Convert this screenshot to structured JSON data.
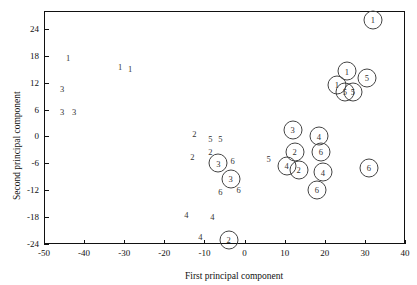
{
  "chart_data": {
    "type": "scatter",
    "title": "",
    "xlabel": "First principal component",
    "ylabel": "Second principal component",
    "xlim": [
      -50,
      40
    ],
    "ylim": [
      -24,
      28
    ],
    "xticks": [
      -50,
      -40,
      -30,
      -20,
      -10,
      0,
      10,
      20,
      30,
      40
    ],
    "yticks": [
      -24,
      -18,
      -12,
      -6,
      0,
      6,
      12,
      18,
      24
    ],
    "grid": false,
    "legend": null,
    "points": [
      {
        "label": "1",
        "x": -44.0,
        "y": 17.5,
        "circled": false
      },
      {
        "label": "1",
        "x": -31.0,
        "y": 15.5,
        "circled": false
      },
      {
        "label": "1",
        "x": -28.5,
        "y": 15.0,
        "circled": false
      },
      {
        "label": "3",
        "x": -45.5,
        "y": 10.5,
        "circled": false
      },
      {
        "label": "3",
        "x": -45.5,
        "y": 5.5,
        "circled": false
      },
      {
        "label": "3",
        "x": -42.5,
        "y": 5.5,
        "circled": false
      },
      {
        "label": "2",
        "x": -12.5,
        "y": 0.5,
        "circled": false
      },
      {
        "label": "5",
        "x": -8.5,
        "y": -0.5,
        "circled": false
      },
      {
        "label": "5",
        "x": -6.0,
        "y": -0.5,
        "circled": false
      },
      {
        "label": "2",
        "x": -13.0,
        "y": -4.5,
        "circled": false
      },
      {
        "label": "2",
        "x": -8.5,
        "y": -3.5,
        "circled": false
      },
      {
        "label": "3",
        "x": -6.5,
        "y": -6.0,
        "circled": true
      },
      {
        "label": "6",
        "x": -3.0,
        "y": -5.5,
        "circled": false
      },
      {
        "label": "3",
        "x": -3.5,
        "y": -9.5,
        "circled": true
      },
      {
        "label": "6",
        "x": -1.5,
        "y": -12.0,
        "circled": false
      },
      {
        "label": "6",
        "x": -6.0,
        "y": -12.5,
        "circled": false
      },
      {
        "label": "4",
        "x": -14.5,
        "y": -17.5,
        "circled": false
      },
      {
        "label": "4",
        "x": -8.0,
        "y": -18.0,
        "circled": false
      },
      {
        "label": "4",
        "x": -11.0,
        "y": -22.5,
        "circled": false
      },
      {
        "label": "2",
        "x": -4.0,
        "y": -23.0,
        "circled": true
      },
      {
        "label": "5",
        "x": 6.0,
        "y": -5.0,
        "circled": false
      },
      {
        "label": "3",
        "x": 12.0,
        "y": 1.5,
        "circled": true
      },
      {
        "label": "2",
        "x": 12.5,
        "y": -3.5,
        "circled": true
      },
      {
        "label": "4",
        "x": 18.5,
        "y": 0.0,
        "circled": true
      },
      {
        "label": "6",
        "x": 19.0,
        "y": -3.5,
        "circled": true
      },
      {
        "label": "4",
        "x": 10.5,
        "y": -6.5,
        "circled": true
      },
      {
        "label": "2",
        "x": 13.5,
        "y": -7.5,
        "circled": true
      },
      {
        "label": "4",
        "x": 19.5,
        "y": -8.0,
        "circled": true
      },
      {
        "label": "6",
        "x": 18.0,
        "y": -12.0,
        "circled": true
      },
      {
        "label": "6",
        "x": 31.0,
        "y": -7.0,
        "circled": true
      },
      {
        "label": "1",
        "x": 32.0,
        "y": 26.0,
        "circled": true
      },
      {
        "label": "1",
        "x": 25.5,
        "y": 14.5,
        "circled": true
      },
      {
        "label": "1",
        "x": 23.0,
        "y": 11.5,
        "circled": true
      },
      {
        "label": "5",
        "x": 25.0,
        "y": 10.0,
        "circled": true
      },
      {
        "label": "5",
        "x": 27.0,
        "y": 10.0,
        "circled": true
      },
      {
        "label": "5",
        "x": 30.5,
        "y": 13.0,
        "circled": true
      }
    ]
  }
}
